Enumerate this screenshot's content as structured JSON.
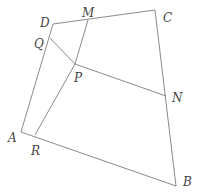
{
  "figure": {
    "type": "geometry-diagram",
    "colors": {
      "line": "#8a8a8a",
      "label": "#444444",
      "background": "#ffffff"
    },
    "points": {
      "A": [
        21,
        132
      ],
      "B": [
        176,
        186
      ],
      "C": [
        155,
        10
      ],
      "D": [
        53,
        24
      ],
      "M": [
        88,
        20
      ],
      "N": [
        166,
        96
      ],
      "P": [
        75,
        64
      ],
      "Q": [
        50,
        38
      ],
      "R": [
        35,
        135
      ]
    },
    "segments": [
      [
        "A",
        "B"
      ],
      [
        "B",
        "C"
      ],
      [
        "C",
        "D"
      ],
      [
        "D",
        "A"
      ],
      [
        "P",
        "M"
      ],
      [
        "P",
        "N"
      ],
      [
        "P",
        "Q"
      ],
      [
        "P",
        "R"
      ]
    ],
    "labels": [
      {
        "text": "D",
        "x": 40,
        "y": 27
      },
      {
        "text": "M",
        "x": 82,
        "y": 17
      },
      {
        "text": "C",
        "x": 163,
        "y": 22
      },
      {
        "text": "Q",
        "x": 34,
        "y": 48
      },
      {
        "text": "P",
        "x": 74,
        "y": 82
      },
      {
        "text": "N",
        "x": 172,
        "y": 102
      },
      {
        "text": "A",
        "x": 8,
        "y": 142
      },
      {
        "text": "R",
        "x": 31,
        "y": 155
      },
      {
        "text": "B",
        "x": 183,
        "y": 186
      }
    ]
  }
}
